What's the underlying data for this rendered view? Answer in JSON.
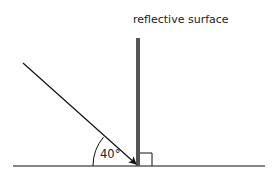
{
  "diagram": {
    "surface_label": "reflective surface",
    "angle_label": "40°",
    "angle_degrees": 40,
    "colors": {
      "line": "#111111",
      "surface": "#555555",
      "text": "#222222",
      "background": "#ffffff"
    },
    "elements": {
      "ground_line": {
        "x1": 13,
        "y1": 166,
        "x2": 265,
        "y2": 166
      },
      "surface": {
        "x": 136,
        "y": 38,
        "width": 4,
        "height": 128
      },
      "incident_ray": {
        "x1": 23,
        "y1": 63,
        "x2": 137,
        "y2": 164
      },
      "right_angle_marker": {
        "x": 140,
        "y": 153,
        "size": 13
      },
      "angle_arc_radius": 45
    }
  }
}
